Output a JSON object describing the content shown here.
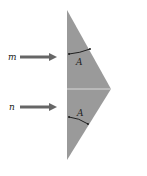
{
  "diagram": {
    "rays": [
      {
        "label": "m"
      },
      {
        "label": "n"
      }
    ],
    "angles": [
      {
        "label": "A"
      },
      {
        "label": "A"
      }
    ],
    "colors": {
      "prism": "#9a9a9a",
      "arrow": "#666666",
      "divider": "#d9d9d9"
    }
  }
}
